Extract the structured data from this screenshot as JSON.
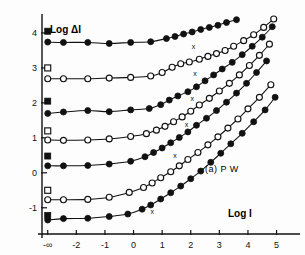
{
  "figure": {
    "panel_annotation": "(a)  P W",
    "xlabel": "Log I",
    "ylabel": "Log ΔI"
  },
  "chart_data": {
    "type": "line",
    "title": "",
    "subtitle": "",
    "xlabel": "Log I",
    "ylabel": "Log ΔI",
    "annotations": [
      "(a)  P W"
    ],
    "grid": false,
    "legend": "none",
    "xlim": [
      -3.2,
      5.4
    ],
    "ylim": [
      -1.75,
      4.6
    ],
    "xticks": [
      -3,
      -2,
      -1,
      0,
      1,
      2,
      3,
      4,
      5
    ],
    "xticklabels": [
      "-∞",
      "-2",
      "-1",
      "0",
      "1",
      "2",
      "3",
      "4",
      "5"
    ],
    "yticks": [
      4,
      3,
      2,
      1,
      0,
      -1
    ],
    "yticklabels": [
      "4",
      "3",
      "2",
      "1",
      "0",
      "-1"
    ],
    "marker_note": "small x glyphs mark the break point of each curve; open squares at left edge are the dark-adapted threshold reference points",
    "series": [
      {
        "name": "curve-1",
        "marker": "filled-circle",
        "plateau": 3.75,
        "break_x": 1.0,
        "slope": 1.0,
        "square_marker": {
          "x": -3.0,
          "y": 4.05
        },
        "x_glyph": null,
        "x": [
          -3.0,
          -2.45,
          -1.6,
          -0.85,
          -0.1,
          0.6,
          1.15,
          1.45,
          1.75,
          2.05,
          2.35,
          2.65,
          2.95,
          3.25,
          3.6
        ],
        "y": [
          3.74,
          3.73,
          3.73,
          3.7,
          3.73,
          3.75,
          3.84,
          3.9,
          3.97,
          4.03,
          4.1,
          4.16,
          4.22,
          4.3,
          4.38
        ]
      },
      {
        "name": "curve-2",
        "marker": "open-circle",
        "plateau": 2.7,
        "break_x": 0.85,
        "slope": 1.0,
        "square_marker": {
          "x": -3.0,
          "y": 3.0
        },
        "x_glyph": {
          "x": 2.1,
          "y": 3.55
        },
        "x": [
          -3.0,
          -2.45,
          -1.6,
          -0.85,
          -0.1,
          0.6,
          1.0,
          1.35,
          1.65,
          1.95,
          2.3,
          2.6,
          2.9,
          3.2,
          3.5,
          3.85,
          4.2,
          4.55,
          4.9
        ],
        "y": [
          2.69,
          2.69,
          2.69,
          2.71,
          2.73,
          2.77,
          2.87,
          3.02,
          3.12,
          3.17,
          3.25,
          3.33,
          3.41,
          3.5,
          3.62,
          3.78,
          3.95,
          4.16,
          4.4
        ]
      },
      {
        "name": "curve-3",
        "marker": "filled-circle",
        "plateau": 1.76,
        "break_x": 0.7,
        "slope": 1.0,
        "square_marker": {
          "x": -3.0,
          "y": 2.05
        },
        "x_glyph": {
          "x": 2.15,
          "y": 2.78
        },
        "x": [
          -3.0,
          -2.45,
          -1.6,
          -0.85,
          -0.1,
          0.55,
          0.95,
          1.25,
          1.55,
          1.9,
          2.2,
          2.5,
          2.8,
          3.1,
          3.45,
          3.8,
          4.15,
          4.5,
          4.85
        ],
        "y": [
          1.7,
          1.74,
          1.78,
          1.75,
          1.8,
          1.84,
          1.95,
          2.08,
          2.2,
          2.32,
          2.46,
          2.63,
          2.8,
          2.97,
          3.16,
          3.38,
          3.62,
          3.88,
          4.18
        ]
      },
      {
        "name": "curve-4",
        "marker": "open-circle",
        "plateau": 0.95,
        "break_x": 0.55,
        "slope": 1.0,
        "square_marker": {
          "x": -3.0,
          "y": 1.2
        },
        "x_glyph": {
          "x": 2.05,
          "y": 2.05
        },
        "x": [
          -3.0,
          -2.45,
          -1.6,
          -0.85,
          -0.1,
          0.45,
          0.8,
          1.1,
          1.4,
          1.7,
          2.0,
          2.3,
          2.65,
          3.0,
          3.35,
          3.7,
          4.05,
          4.4,
          4.75
        ],
        "y": [
          0.94,
          0.93,
          0.94,
          0.97,
          1.04,
          1.12,
          1.22,
          1.33,
          1.46,
          1.6,
          1.76,
          1.94,
          2.13,
          2.34,
          2.56,
          2.8,
          3.07,
          3.36,
          3.68
        ]
      },
      {
        "name": "curve-5",
        "marker": "filled-circle",
        "plateau": 0.2,
        "break_x": 0.3,
        "slope": 1.0,
        "square_marker": {
          "x": -3.0,
          "y": 0.48
        },
        "x_glyph": {
          "x": 1.85,
          "y": 1.32
        },
        "x": [
          -3.0,
          -2.45,
          -1.6,
          -0.85,
          -0.1,
          0.4,
          0.7,
          1.0,
          1.3,
          1.6,
          1.9,
          2.2,
          2.55,
          2.9,
          3.25,
          3.6,
          3.95,
          4.3,
          4.65
        ],
        "y": [
          0.2,
          0.2,
          0.21,
          0.25,
          0.33,
          0.46,
          0.58,
          0.71,
          0.86,
          1.01,
          1.17,
          1.36,
          1.56,
          1.78,
          2.02,
          2.28,
          2.56,
          2.87,
          3.2
        ]
      },
      {
        "name": "curve-6",
        "marker": "open-circle",
        "plateau": -0.76,
        "break_x": 0.1,
        "slope": 1.0,
        "square_marker": {
          "x": -3.0,
          "y": -0.5
        },
        "x_glyph": {
          "x": 1.45,
          "y": 0.42
        },
        "x": [
          -3.0,
          -2.45,
          -1.6,
          -0.85,
          -0.15,
          0.35,
          0.65,
          0.95,
          1.3,
          1.6,
          1.9,
          2.25,
          2.6,
          2.95,
          3.3,
          3.65,
          4.0,
          4.4,
          4.8
        ],
        "y": [
          -0.77,
          -0.77,
          -0.76,
          -0.7,
          -0.56,
          -0.42,
          -0.29,
          -0.14,
          0.03,
          0.2,
          0.38,
          0.58,
          0.8,
          1.03,
          1.28,
          1.54,
          1.83,
          2.16,
          2.52
        ]
      },
      {
        "name": "curve-7",
        "marker": "filled-circle",
        "plateau": -1.3,
        "break_x": -0.2,
        "slope": 1.0,
        "square_marker": {
          "x": -3.0,
          "y": -1.22
        },
        "x_glyph": {
          "x": 0.65,
          "y": -1.18
        },
        "x": [
          -3.0,
          -2.45,
          -1.6,
          -0.85,
          -0.2,
          0.3,
          0.6,
          0.95,
          1.3,
          1.65,
          2.0,
          2.35,
          2.7,
          3.05,
          3.4,
          3.8,
          4.2,
          4.6,
          4.95
        ],
        "y": [
          -1.35,
          -1.31,
          -1.3,
          -1.25,
          -1.18,
          -1.04,
          -0.92,
          -0.75,
          -0.57,
          -0.38,
          -0.17,
          0.05,
          0.3,
          0.56,
          0.83,
          1.13,
          1.46,
          1.8,
          2.16
        ]
      }
    ]
  }
}
